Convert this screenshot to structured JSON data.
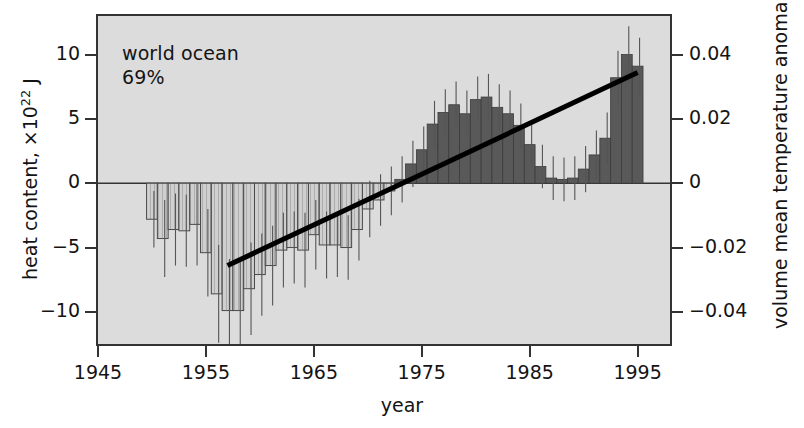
{
  "annotation": {
    "line1": "world ocean",
    "line2": "69%"
  },
  "axes": {
    "left": {
      "title_prefix": "heat content, ×10",
      "title_exponent": "22",
      "title_suffix": " J",
      "ticks": [
        "10",
        "5",
        "0",
        "−5",
        "−10"
      ],
      "tick_values": [
        10,
        5,
        0,
        -5,
        -10
      ]
    },
    "right": {
      "title": "volume mean temperature anomaly, °C",
      "ticks": [
        "0.04",
        "0.02",
        "0",
        "−0.02",
        "−0.04"
      ],
      "tick_values": [
        0.04,
        0.02,
        0,
        -0.02,
        -0.04
      ]
    },
    "bottom": {
      "title": "year",
      "ticks": [
        "1945",
        "1955",
        "1965",
        "1975",
        "1985",
        "1995"
      ],
      "tick_values": [
        1945,
        1955,
        1965,
        1975,
        1985,
        1995
      ]
    }
  },
  "colors": {
    "plot_background": "#dcdcdc",
    "frame": "#333333",
    "bar_negative_fill": "#cfcfcf",
    "bar_negative_edge": "#4a4a4a",
    "bar_positive_fill": "#595959",
    "bar_positive_edge": "#3b3b3b",
    "error_bar": "#555555",
    "trend_line": "#000000",
    "text": "#141414"
  },
  "chart_data": {
    "type": "bar",
    "title": "world ocean 69%",
    "xlabel": "year",
    "ylabel": "heat content, ×10^22 J",
    "y2label": "volume mean temperature anomaly, °C",
    "xlim": [
      1945,
      1998
    ],
    "ylim": [
      -12.5,
      13.0
    ],
    "y2lim": [
      -0.05,
      0.052
    ],
    "grid": false,
    "legend": null,
    "y_to_y2_factor": 0.004,
    "x": [
      1950,
      1951,
      1952,
      1953,
      1954,
      1955,
      1956,
      1957,
      1958,
      1959,
      1960,
      1961,
      1962,
      1963,
      1964,
      1965,
      1966,
      1967,
      1968,
      1969,
      1970,
      1971,
      1972,
      1973,
      1974,
      1975,
      1976,
      1977,
      1978,
      1979,
      1980,
      1981,
      1982,
      1983,
      1984,
      1985,
      1986,
      1987,
      1988,
      1989,
      1990,
      1991,
      1992,
      1993,
      1994,
      1995
    ],
    "values": [
      -2.8,
      -4.3,
      -3.6,
      -3.7,
      -3.2,
      -5.4,
      -8.6,
      -9.9,
      -9.9,
      -8.2,
      -7.1,
      -6.4,
      -5.2,
      -5.0,
      -5.2,
      -4.0,
      -4.8,
      -4.8,
      -5.0,
      -3.6,
      -2.0,
      -1.3,
      -0.6,
      0.3,
      1.5,
      2.6,
      4.6,
      5.5,
      6.1,
      5.4,
      6.5,
      6.7,
      5.9,
      5.4,
      4.5,
      3.0,
      1.3,
      0.4,
      0.3,
      0.4,
      1.1,
      2.2,
      3.5,
      8.2,
      10.0,
      9.1
    ],
    "errors": [
      2.2,
      3.0,
      2.8,
      2.8,
      3.2,
      3.4,
      3.8,
      4.0,
      4.0,
      3.6,
      3.2,
      3.1,
      2.9,
      2.8,
      2.9,
      2.7,
      2.6,
      2.5,
      2.5,
      2.4,
      2.2,
      2.0,
      1.9,
      1.8,
      1.8,
      1.8,
      1.8,
      1.8,
      1.8,
      1.8,
      1.8,
      1.8,
      1.8,
      1.8,
      1.7,
      1.7,
      1.7,
      1.7,
      1.7,
      1.7,
      1.8,
      1.9,
      2.0,
      2.1,
      2.2,
      2.2
    ],
    "trend_line": {
      "x_start": 1957,
      "y_start": -6.4,
      "x_end": 1995,
      "y_end": 8.6
    }
  }
}
